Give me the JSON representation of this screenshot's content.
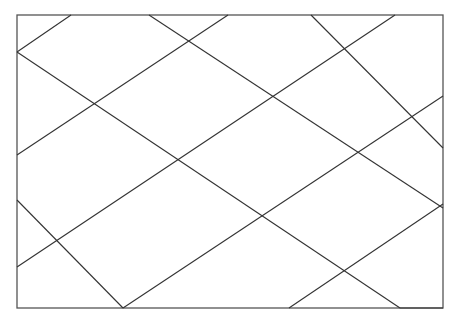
{
  "diagram": {
    "title": "",
    "line_color": "#333333",
    "frame_color": "#555555",
    "background": "#ffffff"
  },
  "bleed_through_text": ""
}
